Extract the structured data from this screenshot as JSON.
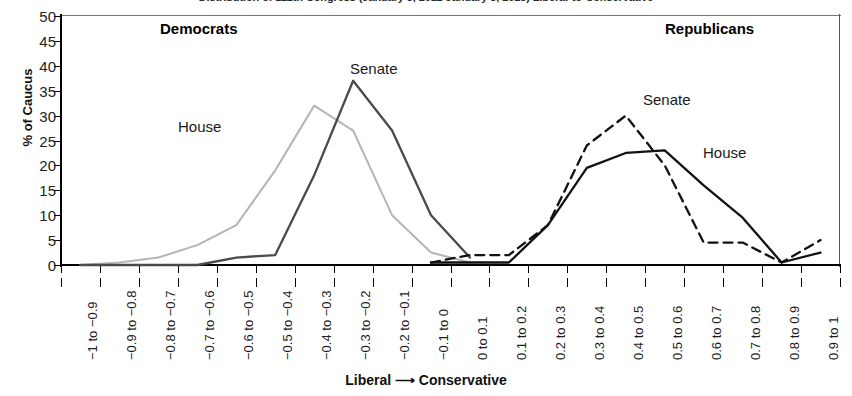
{
  "title": "Distribution of 112th Congress (January 3, 2011-January 3, 2013) Liberal-to-Conservative",
  "axes": {
    "y_title": "% of Caucus",
    "x_title": "Liberal ⟶ Conservative",
    "y_ticks": [
      "50",
      "45",
      "40",
      "35",
      "30",
      "25",
      "20",
      "15",
      "10",
      "5",
      "0"
    ],
    "x_categories": [
      "−1 to −0.9",
      "−0.9 to −0.8",
      "−0.8 to −0.7",
      "−0.7 to −0.6",
      "−0.6 to −0.5",
      "−0.5 to −0.4",
      "−0.4 to −0.3",
      "−0.3 to −0.2",
      "−0.2 to −0.1",
      "−0.1 to 0",
      "0 to 0.1",
      "0.1 to 0.2",
      "0.2 to 0.3",
      "0.3 to 0.4",
      "0.4 to 0.5",
      "0.5 to 0.6",
      "0.6 to 0.7",
      "0.7 to 0.8",
      "0.8 to 0.9",
      "0.9 to 1"
    ]
  },
  "annotations": {
    "democrats": "Democrats",
    "republicans": "Republicans",
    "dem_house": "House",
    "dem_senate": "Senate",
    "rep_senate": "Senate",
    "rep_house": "House"
  },
  "colors": {
    "dem_house": "#b5b5b5",
    "dem_senate": "#4a4a4a",
    "rep_house": "#111111",
    "rep_senate": "#111111",
    "axis": "#000000"
  },
  "chart_data": {
    "type": "line",
    "title": "Distribution of 112th Congress (January 3, 2011-January 3, 2013) Liberal-to-Conservative",
    "xlabel": "Liberal ⟶ Conservative",
    "ylabel": "% of Caucus",
    "ylim": [
      0,
      50
    ],
    "ytick_step": 5,
    "grid": false,
    "legend": "inline annotations",
    "categories": [
      "−1 to −0.9",
      "−0.9 to −0.8",
      "−0.8 to −0.7",
      "−0.7 to −0.6",
      "−0.6 to −0.5",
      "−0.5 to −0.4",
      "−0.4 to −0.3",
      "−0.3 to −0.2",
      "−0.2 to −0.1",
      "−0.1 to 0",
      "0 to 0.1",
      "0.1 to 0.2",
      "0.2 to 0.3",
      "0.3 to 0.4",
      "0.4 to 0.5",
      "0.5 to 0.6",
      "0.6 to 0.7",
      "0.7 to 0.8",
      "0.8 to 0.9",
      "0.9 to 1"
    ],
    "series": [
      {
        "name": "Democratic House",
        "group": "Democrats",
        "style": "solid-light",
        "color": "#b5b5b5",
        "values": [
          0,
          0.5,
          1.5,
          4,
          8,
          19,
          32,
          27,
          10,
          2.5,
          0.5,
          null,
          null,
          null,
          null,
          null,
          null,
          null,
          null,
          null
        ]
      },
      {
        "name": "Democratic Senate",
        "group": "Democrats",
        "style": "solid-dark",
        "color": "#4a4a4a",
        "values": [
          0,
          0,
          0,
          0,
          1.5,
          2,
          18,
          37,
          27,
          10,
          1.5,
          null,
          null,
          null,
          null,
          null,
          null,
          null,
          null,
          null
        ]
      },
      {
        "name": "Republican Senate",
        "group": "Republicans",
        "style": "dashed",
        "color": "#111111",
        "values": [
          null,
          null,
          null,
          null,
          null,
          null,
          null,
          null,
          null,
          0.5,
          2,
          2,
          8,
          24,
          30,
          20,
          4.5,
          4.5,
          0.5,
          5
        ]
      },
      {
        "name": "Republican House",
        "group": "Republicans",
        "style": "solid",
        "color": "#111111",
        "values": [
          null,
          null,
          null,
          null,
          null,
          null,
          null,
          null,
          null,
          0.5,
          0.5,
          0.5,
          8,
          19.5,
          22.5,
          23,
          16,
          9.5,
          0.5,
          2.5
        ]
      }
    ]
  }
}
